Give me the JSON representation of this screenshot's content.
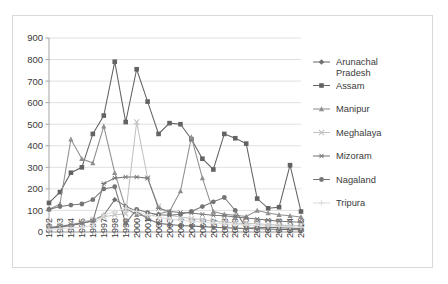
{
  "chart_data": {
    "type": "line",
    "title": "",
    "subtitle": "",
    "xlabel": "",
    "ylabel": "",
    "ylim": [
      0,
      900
    ],
    "ytick_step": 100,
    "yticks": [
      "0",
      "100",
      "200",
      "300",
      "400",
      "500",
      "600",
      "700",
      "800",
      "900"
    ],
    "grid": true,
    "legend_position": "right",
    "x_tick_rotation": -90,
    "categories": [
      "1992",
      "1993",
      "1994",
      "1995",
      "1996",
      "1997",
      "1998",
      "1999",
      "2000",
      "2001",
      "2002",
      "2003",
      "2004",
      "2005",
      "2006",
      "2007",
      "2008",
      "2009",
      "2010",
      "2011",
      "2012",
      "2013",
      "2014",
      "2015"
    ],
    "series": [
      {
        "name": "Arunachal Pradesh",
        "marker": "diamond",
        "color": "#6e6e6e",
        "values": [
          18,
          22,
          30,
          40,
          55,
          78,
          150,
          120,
          95,
          62,
          40,
          35,
          30,
          28,
          25,
          22,
          20,
          18,
          16,
          15,
          14,
          12,
          12,
          10
        ]
      },
      {
        "name": "Assam",
        "marker": "square",
        "color": "#636363",
        "values": [
          135,
          185,
          275,
          300,
          455,
          540,
          790,
          510,
          755,
          605,
          455,
          505,
          500,
          430,
          340,
          290,
          455,
          435,
          410,
          155,
          110,
          115,
          310,
          95
        ]
      },
      {
        "name": "Manipur",
        "marker": "triangle",
        "color": "#8f8f8f",
        "values": [
          105,
          130,
          430,
          340,
          320,
          490,
          275,
          110,
          80,
          72,
          85,
          95,
          190,
          440,
          250,
          95,
          82,
          78,
          72,
          100,
          88,
          80,
          75,
          70
        ]
      },
      {
        "name": "Meghalaya",
        "marker": "cross",
        "color": "#c2c2c2",
        "values": [
          22,
          28,
          35,
          45,
          58,
          70,
          80,
          85,
          510,
          250,
          120,
          78,
          70,
          62,
          58,
          50,
          46,
          42,
          40,
          38,
          35,
          32,
          30,
          28
        ]
      },
      {
        "name": "Mizoram",
        "marker": "asterisk",
        "color": "#7a7a7a",
        "values": [
          20,
          26,
          34,
          42,
          50,
          225,
          250,
          255,
          255,
          250,
          110,
          95,
          90,
          88,
          82,
          78,
          75,
          70,
          65,
          60,
          55,
          50,
          48,
          45
        ]
      },
      {
        "name": "Nagaland",
        "marker": "circle",
        "color": "#757575",
        "values": [
          105,
          118,
          125,
          130,
          150,
          200,
          210,
          40,
          105,
          90,
          80,
          78,
          82,
          95,
          118,
          140,
          160,
          100,
          18,
          20,
          22,
          20,
          18,
          16
        ]
      },
      {
        "name": "Tripura",
        "marker": "plus",
        "color": "#dcdcdc",
        "values": [
          12,
          15,
          18,
          22,
          30,
          80,
          95,
          110,
          95,
          80,
          70,
          60,
          55,
          50,
          45,
          42,
          38,
          35,
          32,
          30,
          28,
          26,
          24,
          22
        ]
      }
    ]
  },
  "legend": {
    "entries": [
      {
        "label": "Arunachal Pradesh"
      },
      {
        "label": "Assam"
      },
      {
        "label": "Manipur"
      },
      {
        "label": "Meghalaya"
      },
      {
        "label": "Mizoram"
      },
      {
        "label": "Nagaland"
      },
      {
        "label": "Tripura"
      }
    ]
  }
}
